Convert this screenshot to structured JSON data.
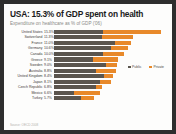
{
  "chart_data": {
    "type": "bar",
    "title": "USA: 15.3% of GDP spent on health",
    "subtitle": "Expenditure on healthcare as % of GDP ('06)",
    "xlabel": "",
    "ylabel": "",
    "orientation": "horizontal",
    "stacked": true,
    "grid": false,
    "legend_position": "right",
    "xlim": [
      0,
      16
    ],
    "colors": {
      "public": "#5a554e",
      "private": "#e8892a",
      "background": "#fdfdfc",
      "title": "#1b1b1b",
      "subtitle": "#8b8b88"
    },
    "categories": [
      "United States",
      "Switzerland",
      "France",
      "Germany",
      "Canada",
      "Greece",
      "Sweden",
      "Australia",
      "United Kingdom",
      "Japan",
      "Czech Republic",
      "Mexico",
      "Turkey"
    ],
    "value_labels": [
      "15.3%",
      "11.3%",
      "11.0%",
      "10.6%",
      "10.0%",
      "9.1%",
      "9.0%",
      "8.8%",
      "8.4%",
      "8.1%",
      "6.8%",
      "6.6%",
      "5.7%"
    ],
    "totals": [
      15.3,
      11.3,
      11.0,
      10.6,
      10.0,
      9.1,
      9.0,
      8.8,
      8.4,
      8.1,
      6.8,
      6.6,
      5.7
    ],
    "series": [
      {
        "name": "Public",
        "color": "#5a554e",
        "values": [
          7.0,
          6.8,
          8.7,
          8.1,
          7.0,
          5.6,
          7.4,
          6.0,
          7.2,
          6.6,
          6.0,
          2.9,
          3.8
        ]
      },
      {
        "name": "Private",
        "color": "#e8892a",
        "values": [
          8.3,
          4.5,
          2.3,
          2.5,
          3.0,
          3.5,
          1.6,
          2.8,
          1.2,
          1.5,
          0.8,
          3.7,
          1.9
        ]
      }
    ],
    "legend": [
      {
        "label": "Public",
        "color": "#5a554e"
      },
      {
        "label": "Private",
        "color": "#e8892a"
      }
    ],
    "source": "Source: OECD 2008"
  }
}
